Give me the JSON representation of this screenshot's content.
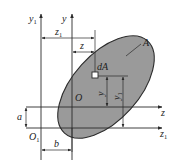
{
  "figure": {
    "colors": {
      "line": "#2a2a2a",
      "fill": "#9a9a9a",
      "background": "#ffffff"
    },
    "labels": {
      "y1_axis": "y",
      "y1_sub": "1",
      "y_axis": "y",
      "z_axis": "z",
      "z1_axis": "z",
      "z1_sub": "1",
      "origin": "O",
      "origin1": "O",
      "origin1_sub": "1",
      "area": "A",
      "element": "dA",
      "dim_z1": "z",
      "dim_z1_sub": "1",
      "dim_z": "z",
      "dim_y": "y",
      "dim_y1": "y",
      "dim_y1_sub": "1",
      "dim_a": "a",
      "dim_b": "b"
    }
  }
}
